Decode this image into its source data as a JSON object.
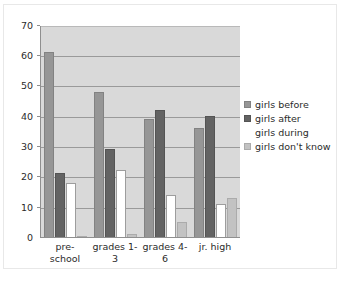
{
  "chart_data": {
    "type": "bar",
    "title": "",
    "subtitle": "",
    "xlabel": "",
    "ylabel": "",
    "categories": [
      "pre-school",
      "grades 1-3",
      "grades 4-6",
      "jr. high"
    ],
    "category_lines": [
      [
        "pre-",
        "school"
      ],
      [
        "grades 1-",
        "3"
      ],
      [
        "grades 4-",
        "6"
      ],
      [
        "jr. high",
        ""
      ]
    ],
    "series": [
      {
        "name": "girls before",
        "color": "#969696",
        "values": [
          61,
          48,
          39,
          36
        ]
      },
      {
        "name": "girls after",
        "color": "#636363",
        "values": [
          21,
          29,
          42,
          40
        ]
      },
      {
        "name": "girls during",
        "color": "#ffffff",
        "values": [
          18,
          22,
          14,
          11
        ]
      },
      {
        "name": "girls don't know",
        "color": "#c2c2c2",
        "values": [
          0,
          1,
          5,
          13
        ]
      }
    ],
    "ylim": [
      0,
      70
    ],
    "ytick_step": 10,
    "yticks": [
      70,
      60,
      50,
      40,
      30,
      20,
      10,
      0
    ],
    "grid": true,
    "grid_axis": "y",
    "legend_position": "right",
    "plot_background": "#d9d9d9",
    "figure_background": "#ffffff"
  }
}
